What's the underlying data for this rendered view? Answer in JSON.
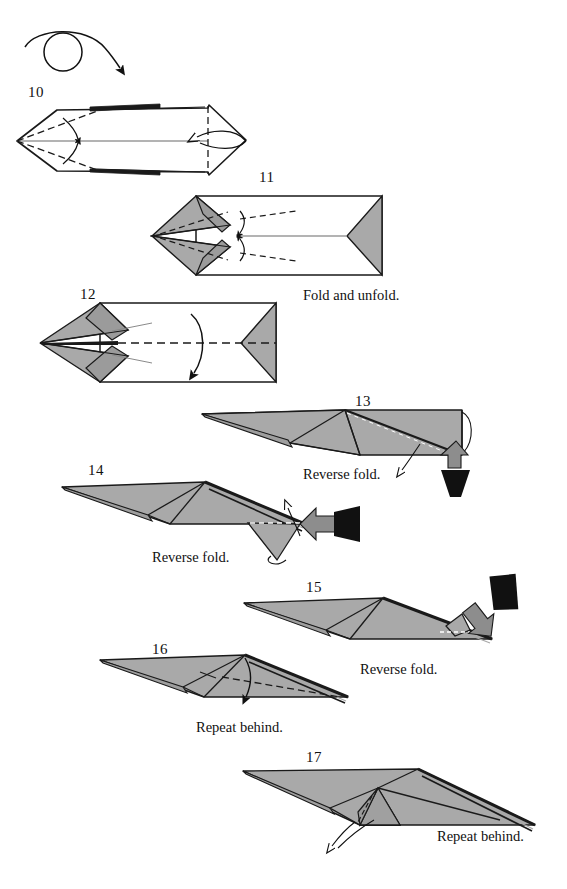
{
  "page": {
    "width": 567,
    "height": 889,
    "background": "#ffffff",
    "paper_front_color": "#a9a9a9",
    "paper_back_color": "#ffffff",
    "line_color": "#1a1a1a",
    "arrow_fill_dark": "#111111",
    "arrow_fill_gray": "#8d8d8d"
  },
  "symbols": {
    "turn_over": {
      "name": "turn-over-symbol",
      "description": "circle with curved arrow looping over it"
    }
  },
  "steps": [
    {
      "number": "10",
      "num_x": 28,
      "num_y": 84,
      "caption": "",
      "shape": "flat hexagonal form, white side up, with dashed valley folds at left point and vertical dashed fold at right",
      "has_turn_over_symbol": true
    },
    {
      "number": "11",
      "num_x": 259,
      "num_y": 169,
      "caption": "Fold and unfold.",
      "caption_x": 303,
      "caption_y": 287,
      "shape": "gray pointed form with two small dashed folds near center"
    },
    {
      "number": "12",
      "num_x": 80,
      "num_y": 286,
      "caption": "",
      "shape": "gray pointed form with long horizontal dashed fold line and downward arrow"
    },
    {
      "number": "13",
      "num_x": 355,
      "num_y": 393,
      "caption": "Reverse fold.",
      "caption_x": 303,
      "caption_y": 466,
      "shape": "gray angled dart form with push arrow at right"
    },
    {
      "number": "14",
      "num_x": 88,
      "num_y": 462,
      "caption": "Reverse fold.",
      "caption_x": 152,
      "caption_y": 549,
      "shape": "gray angled dart form with hanging flap and horizontal push arrow"
    },
    {
      "number": "15",
      "num_x": 306,
      "num_y": 579,
      "caption": "Reverse fold.",
      "caption_x": 360,
      "caption_y": 661,
      "shape": "gray angled dart form with diagonal push arrow from upper right"
    },
    {
      "number": "16",
      "num_x": 152,
      "num_y": 641,
      "caption": "Repeat behind.",
      "caption_x": 196,
      "caption_y": 719,
      "shape": "gray swept form with dashed fold and downward arrow"
    },
    {
      "number": "17",
      "num_x": 306,
      "num_y": 749,
      "caption": "Repeat behind.",
      "caption_x": 437,
      "caption_y": 828,
      "shape": "gray swept form with small pleat and thin pointer arrow"
    }
  ]
}
